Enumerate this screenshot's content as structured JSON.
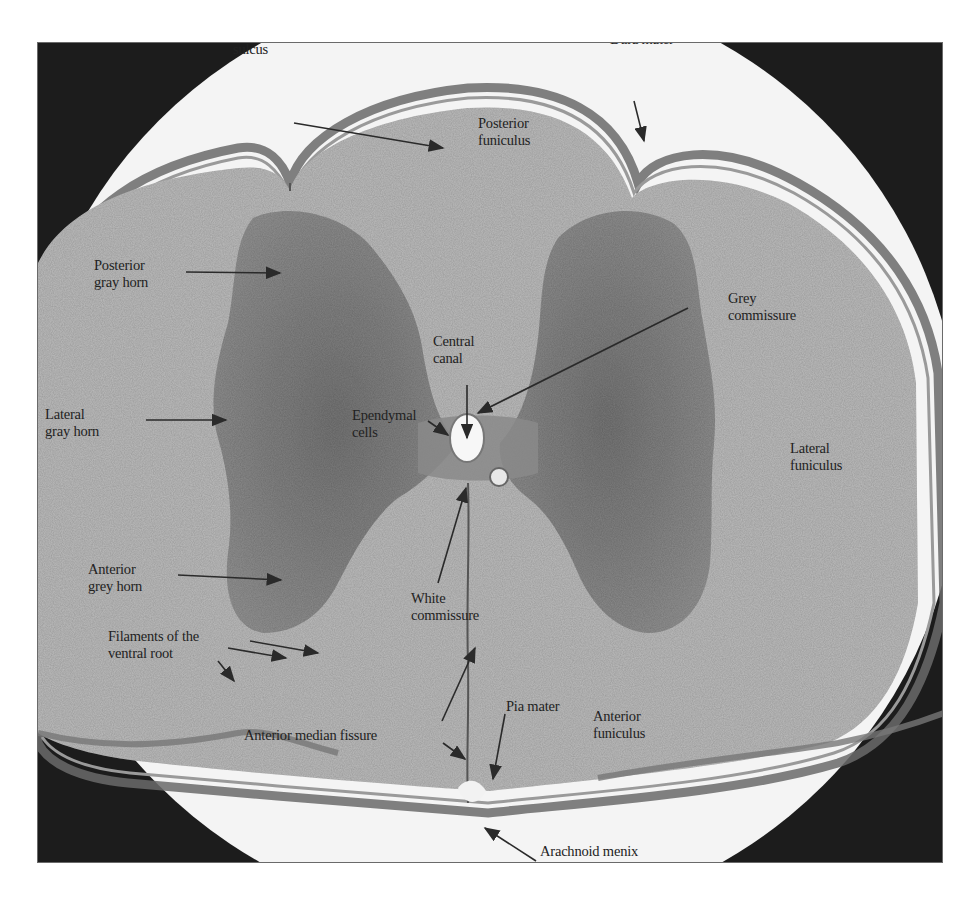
{
  "figure": {
    "colors": {
      "frame_background": "#1c1c1c",
      "field_background": "#f4f4f4",
      "white_matter": "#b9b9b9",
      "grey_matter": "#7e7e7e",
      "meninges": "#6e6e6e",
      "label_text": "#222222",
      "arrow": "#2a2a2a"
    }
  },
  "labels": {
    "posterior_median_sulcus": "Posterior median\nsulcus",
    "dura_mater": "Dura mater",
    "posterior_funiculus": "Posterior\nfuniculus",
    "posterior_gray_horn": "Posterior\ngray horn",
    "grey_commissure": "Grey\ncommissure",
    "central_canal": "Central\ncanal",
    "ependymal_cells": "Ependymal\ncells",
    "lateral_gray_horn": "Lateral\ngray horn",
    "lateral_funiculus": "Lateral\nfuniculus",
    "anterior_grey_horn": "Anterior\ngrey horn",
    "white_commissure": "White\ncommissure",
    "filaments_ventral_root": "Filaments of the\nventral root",
    "anterior_median_fissure": "Anterior median fissure",
    "pia_mater": "Pia mater",
    "anterior_funiculus": "Anterior\nfuniculus",
    "arachnoid_menix": "Arachnoid menix"
  }
}
